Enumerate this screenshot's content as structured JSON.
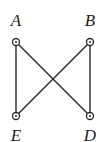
{
  "diagram": {
    "type": "graph",
    "nodes": [
      {
        "id": "A",
        "label": "A",
        "x": 16,
        "y": 42,
        "label_x": 16,
        "label_y": 26
      },
      {
        "id": "B",
        "label": "B",
        "x": 90,
        "y": 42,
        "label_x": 90,
        "label_y": 26
      },
      {
        "id": "E",
        "label": "E",
        "x": 16,
        "y": 116,
        "label_x": 16,
        "label_y": 141
      },
      {
        "id": "D",
        "label": "D",
        "x": 90,
        "y": 116,
        "label_x": 90,
        "label_y": 141
      }
    ],
    "edges": [
      {
        "from": "A",
        "to": "E"
      },
      {
        "from": "A",
        "to": "D"
      },
      {
        "from": "B",
        "to": "E"
      },
      {
        "from": "B",
        "to": "D"
      }
    ],
    "colors": {
      "stroke": "#2a2a2a",
      "background": "#ffffff"
    }
  }
}
